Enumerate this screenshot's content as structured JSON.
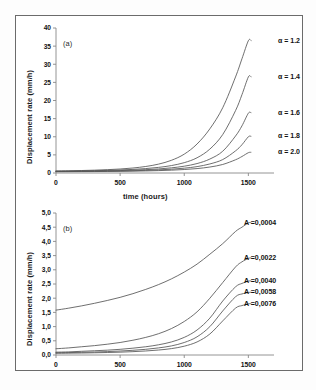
{
  "figure": {
    "background": "#ffffff",
    "border_color": "#6b6b6b",
    "curve_color": "#555555",
    "axis_color": "#888888"
  },
  "chart_data": [
    {
      "type": "line",
      "panel_label": "(a)",
      "title": "",
      "xlabel": "time (hours)",
      "ylabel": "Displacement rate (mm/h)",
      "xlim": [
        0,
        1700
      ],
      "ylim": [
        0,
        40
      ],
      "xticks": [
        0,
        500,
        1000,
        1500
      ],
      "xticklabels": [
        "0",
        "500",
        "1000",
        "1500"
      ],
      "yticks": [
        0,
        5,
        10,
        15,
        20,
        25,
        30,
        35,
        40
      ],
      "yticklabels": [
        "0",
        "5",
        "10",
        "15",
        "20",
        "25",
        "30",
        "35",
        "40"
      ],
      "grid": false,
      "legend_position": "right-inline",
      "x": [
        0,
        100,
        200,
        300,
        400,
        500,
        600,
        700,
        800,
        900,
        1000,
        1100,
        1200,
        1300,
        1400,
        1450,
        1500,
        1520
      ],
      "series": [
        {
          "name": "alpha-1.2",
          "label": "α = 1.2",
          "values": [
            0.55,
            0.6,
            0.68,
            0.78,
            0.92,
            1.1,
            1.38,
            1.8,
            2.45,
            3.5,
            5.2,
            8.0,
            12.2,
            18.0,
            26.5,
            31.5,
            36.5,
            36.5
          ]
        },
        {
          "name": "alpha-1.4",
          "label": "α = 1.4",
          "values": [
            0.5,
            0.53,
            0.58,
            0.64,
            0.72,
            0.84,
            1.0,
            1.22,
            1.55,
            2.05,
            2.85,
            4.2,
            6.6,
            10.6,
            17.2,
            21.6,
            26.5,
            26.5
          ]
        },
        {
          "name": "alpha-1.6",
          "label": "α = 1.6",
          "values": [
            0.45,
            0.47,
            0.5,
            0.54,
            0.6,
            0.67,
            0.78,
            0.92,
            1.12,
            1.42,
            1.88,
            2.6,
            3.85,
            6.0,
            10.2,
            13.0,
            16.5,
            16.6
          ]
        },
        {
          "name": "alpha-1.8",
          "label": "α = 1.8",
          "values": [
            0.4,
            0.42,
            0.44,
            0.47,
            0.51,
            0.56,
            0.63,
            0.73,
            0.86,
            1.05,
            1.33,
            1.76,
            2.5,
            3.7,
            6.1,
            7.8,
            10.0,
            10.1
          ]
        },
        {
          "name": "alpha-2.0",
          "label": "α = 2.0",
          "values": [
            0.35,
            0.36,
            0.38,
            0.4,
            0.43,
            0.46,
            0.51,
            0.57,
            0.66,
            0.78,
            0.96,
            1.22,
            1.65,
            2.35,
            3.65,
            4.55,
            5.6,
            5.7
          ]
        }
      ]
    },
    {
      "type": "line",
      "panel_label": "(b)",
      "title": "",
      "xlabel": "",
      "ylabel": "Displacement rate (mm/h)",
      "xlim": [
        0,
        1700
      ],
      "ylim": [
        0,
        5.0
      ],
      "xticks": [
        0,
        500,
        1000,
        1500
      ],
      "xticklabels": [
        "0",
        "500",
        "1000",
        "1500"
      ],
      "yticks": [
        0.0,
        0.5,
        1.0,
        1.5,
        2.0,
        2.5,
        3.0,
        3.5,
        4.0,
        4.5,
        5.0
      ],
      "yticklabels": [
        "0,0",
        "0,5",
        "1,0",
        "1,5",
        "2,0",
        "2,5",
        "3,0",
        "3,5",
        "4,0",
        "4,5",
        "5,0"
      ],
      "grid": false,
      "legend_position": "right-inline",
      "x": [
        0,
        100,
        200,
        300,
        400,
        500,
        600,
        700,
        800,
        900,
        1000,
        1100,
        1200,
        1300,
        1400,
        1450,
        1500,
        1520
      ],
      "series": [
        {
          "name": "A-0.0004",
          "label": "A =0,0004",
          "values": [
            1.58,
            1.65,
            1.73,
            1.82,
            1.92,
            2.03,
            2.16,
            2.31,
            2.48,
            2.68,
            2.92,
            3.2,
            3.55,
            3.92,
            4.35,
            4.5,
            4.65,
            4.66
          ]
        },
        {
          "name": "A-0.0022",
          "label": "A =0,0022",
          "values": [
            0.22,
            0.25,
            0.29,
            0.33,
            0.38,
            0.44,
            0.52,
            0.62,
            0.75,
            0.93,
            1.18,
            1.52,
            2.0,
            2.55,
            3.1,
            3.28,
            3.4,
            3.42
          ]
        },
        {
          "name": "A-0.0040",
          "label": "A =0,0040",
          "values": [
            0.1,
            0.11,
            0.13,
            0.15,
            0.17,
            0.2,
            0.24,
            0.29,
            0.36,
            0.46,
            0.62,
            0.88,
            1.3,
            1.9,
            2.4,
            2.52,
            2.6,
            2.61
          ]
        },
        {
          "name": "A-0.0058",
          "label": "A =0,0058",
          "values": [
            0.08,
            0.085,
            0.095,
            0.105,
            0.12,
            0.14,
            0.165,
            0.2,
            0.25,
            0.32,
            0.44,
            0.64,
            1.0,
            1.55,
            2.05,
            2.15,
            2.2,
            2.21
          ]
        },
        {
          "name": "A-0.0076",
          "label": "A =0,0076",
          "values": [
            0.06,
            0.065,
            0.07,
            0.078,
            0.088,
            0.1,
            0.118,
            0.142,
            0.175,
            0.225,
            0.31,
            0.46,
            0.74,
            1.2,
            1.65,
            1.74,
            1.8,
            1.81
          ]
        }
      ]
    }
  ]
}
